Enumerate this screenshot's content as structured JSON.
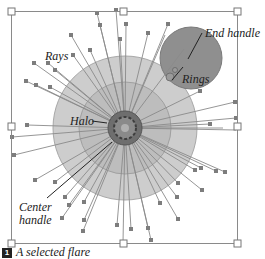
{
  "figure": {
    "caption_number": "1",
    "caption_text": "A selected flare",
    "labels": {
      "rays": "Rays",
      "halo": "Halo",
      "center_handle": "Center handle",
      "center_line1": "Center",
      "center_line2": "handle",
      "end_handle": "End handle",
      "rings": "Rings"
    },
    "colors": {
      "halo_outer": "#c8c8c8",
      "halo_inner": "#b4b4b4",
      "ring": "#8c8c8c",
      "ray": "#8a8a8a",
      "handle": "#7a7a7a",
      "bbox": "#8a8a8a"
    }
  }
}
